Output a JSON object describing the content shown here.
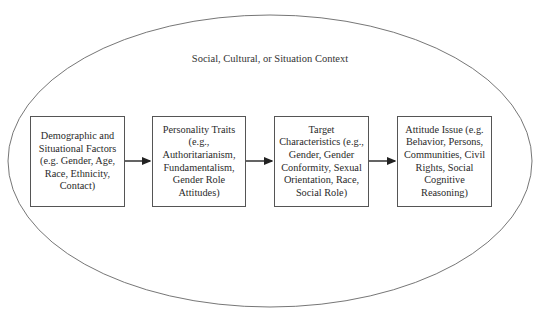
{
  "diagram": {
    "context_label": "Social, Cultural, or Situation Context",
    "boxes": [
      {
        "text": "Demographic and\nSituational Factors\n(e.g. Gender, Age,\nRace, Ethnicity,\nContact)"
      },
      {
        "text": "Personality Traits\n(e.g.,\nAuthoritarianism,\nFundamentalism,\nGender Role\nAttitudes)"
      },
      {
        "text": "Target\nCharacteristics (e.g.,\nGender, Gender\nConformity, Sexual\nOrientation, Race,\nSocial Role)"
      },
      {
        "text": "Attitude Issue (e.g.\nBehavior, Persons,\nCommunities, Civil\nRights, Social\nCognitive\nReasoning)"
      }
    ],
    "colors": {
      "stroke": "#555555",
      "arrow": "#222222",
      "text": "#2a2a2a"
    }
  }
}
